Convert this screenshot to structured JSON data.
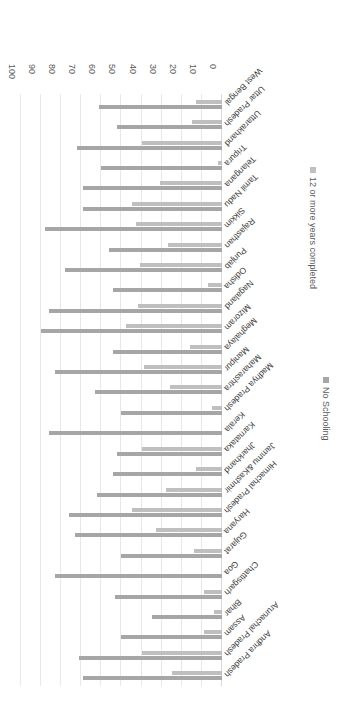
{
  "chart_data": {
    "type": "bar",
    "orientation": "horizontal",
    "title": "",
    "subtitle": "",
    "xlabel": "",
    "ylabel": "",
    "xlim": [
      0,
      100
    ],
    "xticks": [
      0,
      10,
      20,
      30,
      40,
      50,
      60,
      70,
      80,
      90,
      100
    ],
    "grid": true,
    "legend_position": "bottom-right",
    "rotation_deg": 180,
    "colors": {
      "no_schooling": "#a6a6a6",
      "twelve_or_more": "#bfbfbf",
      "gridline": "#e8e8e8",
      "axis": "#d9d9d9",
      "text": "#595959",
      "background": "#ffffff"
    },
    "categories": [
      "Andhra Pradesh",
      "Arunachal Pradesh",
      "Assam",
      "Bihar",
      "Chattisgarh",
      "Goa",
      "Gujarat",
      "Haryana",
      "Himachal Pradesh",
      "Jammu &Kashmir",
      "Jharkhand",
      "Karnataka",
      "Kerala",
      "Madhya Pradesh",
      "Maharashtra",
      "Manipur",
      "Meghalaya",
      "Mizoram",
      "Nagaland",
      "Odisha",
      "Punjab",
      "Rajasthan",
      "Sikkim",
      "Tamil Nadu",
      "Telangana",
      "Tripura",
      "Uttarakhand",
      "Uttar Pradesh",
      "West Bengal"
    ],
    "series": [
      {
        "name": "No Schooling",
        "color": "#a6a6a6",
        "values": [
          69,
          71,
          50,
          35,
          53,
          83,
          50,
          73,
          76,
          62,
          54,
          52,
          86,
          50,
          63,
          83,
          54,
          90,
          86,
          54,
          78,
          56,
          88,
          69,
          69,
          60,
          72,
          52,
          61
        ]
      },
      {
        "name": "12 or more years completed",
        "color": "#bfbfbf",
        "values": [
          25,
          40,
          9,
          4,
          9,
          0,
          14,
          33,
          45,
          28,
          13,
          40,
          0,
          5,
          26,
          39,
          16,
          48,
          42,
          7,
          41,
          27,
          43,
          45,
          31,
          2,
          40,
          15,
          13
        ]
      }
    ],
    "legend": [
      {
        "label": "No Schooling",
        "color": "#a6a6a6"
      },
      {
        "label": "12 or more years completed",
        "color": "#bfbfbf"
      }
    ]
  }
}
